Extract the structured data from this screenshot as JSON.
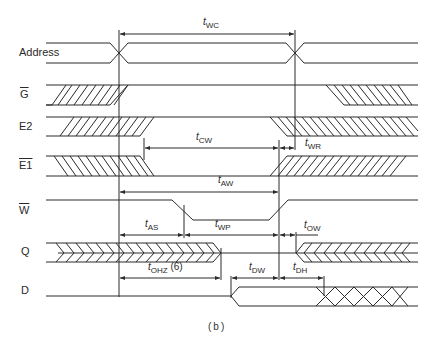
{
  "diagram": {
    "type": "timing-diagram",
    "caption": "(b)",
    "colors": {
      "line": "#2a2a2a",
      "background": "#ffffff"
    },
    "signals": [
      {
        "id": "address",
        "label": "Address",
        "overline": false
      },
      {
        "id": "g",
        "label": "G",
        "overline": true
      },
      {
        "id": "e2",
        "label": "E2",
        "overline": false
      },
      {
        "id": "e1",
        "label": "E1",
        "overline": true
      },
      {
        "id": "w",
        "label": "W",
        "overline": true
      },
      {
        "id": "q",
        "label": "Q",
        "overline": false
      },
      {
        "id": "d",
        "label": "D",
        "overline": false
      }
    ],
    "timing_params": {
      "wc": {
        "prefix": "t",
        "sub": "WC"
      },
      "cw": {
        "prefix": "t",
        "sub": "CW"
      },
      "wr": {
        "prefix": "t",
        "sub": "WR"
      },
      "aw": {
        "prefix": "t",
        "sub": "AW"
      },
      "as": {
        "prefix": "t",
        "sub": "AS"
      },
      "wp": {
        "prefix": "t",
        "sub": "WP"
      },
      "ow": {
        "prefix": "t",
        "sub": "OW"
      },
      "ohz": {
        "prefix": "t",
        "sub": "OHZ",
        "suffix": "(6)"
      },
      "dw": {
        "prefix": "t",
        "sub": "DW"
      },
      "dh": {
        "prefix": "t",
        "sub": "DH"
      }
    }
  }
}
